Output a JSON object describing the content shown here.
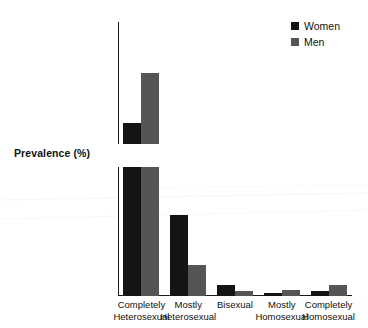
{
  "chart_data": {
    "type": "bar",
    "title": "",
    "xlabel": "",
    "ylabel": "Prevalence (%)",
    "grid": false,
    "legend_position": "top-right",
    "broken_axis": true,
    "axis_segments": [
      {
        "name": "upper",
        "ylim": [
          84,
          100
        ],
        "ticks": [
          84,
          86,
          88,
          90,
          92,
          94,
          96,
          98,
          100
        ]
      },
      {
        "name": "lower",
        "ylim": [
          0,
          16
        ],
        "ticks": [
          0,
          2,
          4,
          6,
          8,
          10,
          12,
          14,
          16
        ]
      }
    ],
    "categories": [
      "Completely Heterosexual",
      "Mostly Heterosexual",
      "Bisexual",
      "Mostly Homosexual",
      "Completely Homosexual"
    ],
    "category_lines": [
      [
        "Completely",
        "Heterosexual"
      ],
      [
        "Mostly",
        "Heterosexual"
      ],
      [
        "Bisexual",
        ""
      ],
      [
        "Mostly",
        "Homosexual"
      ],
      [
        "Completely",
        "Homosexual"
      ]
    ],
    "series": [
      {
        "name": "Women",
        "color": "#141414",
        "values": [
          86.7,
          10.0,
          1.4,
          0.4,
          0.6
        ]
      },
      {
        "name": "Men",
        "color": "#555555",
        "values": [
          93.3,
          3.9,
          0.6,
          0.7,
          1.4
        ]
      }
    ]
  },
  "legend": {
    "items": [
      {
        "label": "Women",
        "color": "#141414"
      },
      {
        "label": "Men",
        "color": "#555555"
      }
    ]
  },
  "axis": {
    "y_label": "Prevalence (%)",
    "upper_tick_labels": [
      "100",
      "98",
      "96",
      "94",
      "92",
      "90",
      "88",
      "86",
      "84"
    ],
    "lower_tick_labels": [
      "16",
      "14",
      "12",
      "10",
      "8",
      "6",
      "4",
      "2",
      "0"
    ]
  }
}
